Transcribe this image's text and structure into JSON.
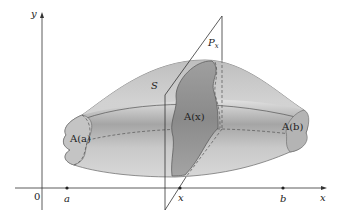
{
  "diagram": {
    "axes": {
      "x_label": "x",
      "y_label": "y",
      "origin_label": "0"
    },
    "points_on_x_axis": [
      {
        "id": "a",
        "label": "a"
      },
      {
        "id": "x",
        "label": "x"
      },
      {
        "id": "b",
        "label": "b"
      }
    ],
    "solid_label": "S",
    "plane_label": {
      "main": "P",
      "subscript": "x"
    },
    "cross_sections": [
      {
        "id": "left",
        "label": "A(a)"
      },
      {
        "id": "middle",
        "label": "A(x)"
      },
      {
        "id": "right",
        "label": "A(b)"
      }
    ],
    "colors": {
      "solid_light": "#d9d9d9",
      "solid_mid": "#b8b8b8",
      "solid_dark": "#8e8e8e",
      "cross_section": "#9a9a9a",
      "lines": "#333333"
    }
  }
}
